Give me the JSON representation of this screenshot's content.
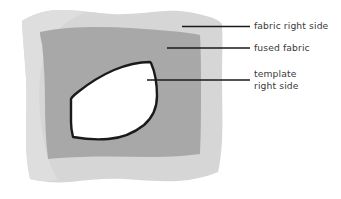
{
  "diagram": {
    "type": "instructional-illustration",
    "colors": {
      "background": "#ffffff",
      "fabric_right_side": "#d6d6d6",
      "fused_fabric": "#a8a8a8",
      "template_right_side": "#ffffff",
      "template_outline": "#1a1a1a",
      "leader_line": "#1a1a1a",
      "label_text": "#3a3a3a"
    },
    "shapes": [
      {
        "name": "fabric-right-side-shape",
        "fill": "#d6d6d6",
        "description": "wavy-edged square of fabric, light gray"
      },
      {
        "name": "fused-fabric-shape",
        "fill": "#a8a8a8",
        "description": "darker gray rectangle of fused fabric laid on the fabric"
      },
      {
        "name": "template-right-side-shape",
        "fill": "#ffffff",
        "stroke": "#1a1a1a",
        "description": "white leaf or petal shaped template with black outline"
      }
    ],
    "callouts": [
      {
        "id": "fabric-right-side",
        "label": "fabric right side",
        "lines": [
          "fabric right side"
        ],
        "leader": {
          "x1": 182,
          "y1": 26.5,
          "x2": 250,
          "y2": 26.5
        }
      },
      {
        "id": "fused-fabric",
        "label": "fused fabric",
        "lines": [
          "fused fabric"
        ],
        "leader": {
          "x1": 167,
          "y1": 48,
          "x2": 250,
          "y2": 48
        }
      },
      {
        "id": "template-right-side",
        "label": "template right side",
        "lines": [
          "template",
          "right side"
        ],
        "leader": {
          "x1": 147,
          "y1": 80,
          "x2": 250,
          "y2": 80
        }
      }
    ]
  }
}
